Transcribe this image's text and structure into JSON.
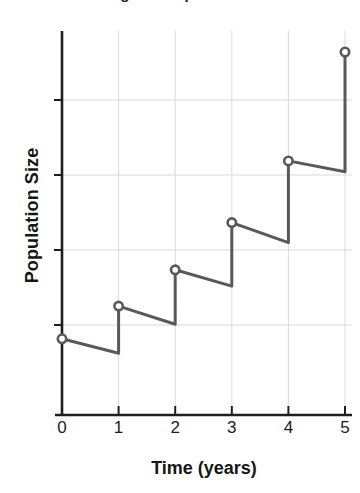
{
  "chart_data": {
    "type": "line",
    "title": "Logistic Population Growth",
    "title_clipped": true,
    "xlabel": "Time (years)",
    "ylabel": "Population Size",
    "xticks": [
      "0",
      "1",
      "2",
      "3",
      "4",
      "5"
    ],
    "yticks": [
      "",
      "",
      "",
      ""
    ],
    "xlim": [
      0,
      5
    ],
    "ylim": [
      0,
      1
    ],
    "grid": true,
    "legend": "none",
    "marker_style": "open-circle",
    "line_color": "#595959",
    "axis_color": "#1f1f1f",
    "grid_color": "#d9d9d9",
    "x": [
      0,
      1,
      2,
      3,
      4,
      5
    ],
    "values": [
      0.21,
      0.3,
      0.4,
      0.53,
      0.7,
      1.0
    ],
    "marker_points": [
      {
        "x": 0,
        "y": 0.21
      },
      {
        "x": 1,
        "y": 0.3
      },
      {
        "x": 2,
        "y": 0.4
      },
      {
        "x": 3,
        "y": 0.53
      },
      {
        "x": 4,
        "y": 0.7
      },
      {
        "x": 5,
        "y": 1.0
      }
    ],
    "segments": [
      {
        "from_x": 0,
        "from_y": 0.21,
        "to_x": 1,
        "to_y": 0.17,
        "kind": "decline"
      },
      {
        "from_x": 1,
        "from_y": 0.17,
        "to_x": 1,
        "to_y": 0.3,
        "kind": "jump"
      },
      {
        "from_x": 1,
        "from_y": 0.3,
        "to_x": 2,
        "to_y": 0.25,
        "kind": "decline"
      },
      {
        "from_x": 2,
        "from_y": 0.25,
        "to_x": 2,
        "to_y": 0.4,
        "kind": "jump"
      },
      {
        "from_x": 2,
        "from_y": 0.4,
        "to_x": 3,
        "to_y": 0.355,
        "kind": "decline"
      },
      {
        "from_x": 3,
        "from_y": 0.355,
        "to_x": 3,
        "to_y": 0.53,
        "kind": "jump"
      },
      {
        "from_x": 3,
        "from_y": 0.53,
        "to_x": 4,
        "to_y": 0.475,
        "kind": "decline"
      },
      {
        "from_x": 4,
        "from_y": 0.475,
        "to_x": 4,
        "to_y": 0.7,
        "kind": "jump"
      },
      {
        "from_x": 4,
        "from_y": 0.7,
        "to_x": 5,
        "to_y": 0.67,
        "kind": "decline"
      },
      {
        "from_x": 5,
        "from_y": 0.67,
        "to_x": 5,
        "to_y": 1.0,
        "kind": "jump"
      }
    ]
  }
}
